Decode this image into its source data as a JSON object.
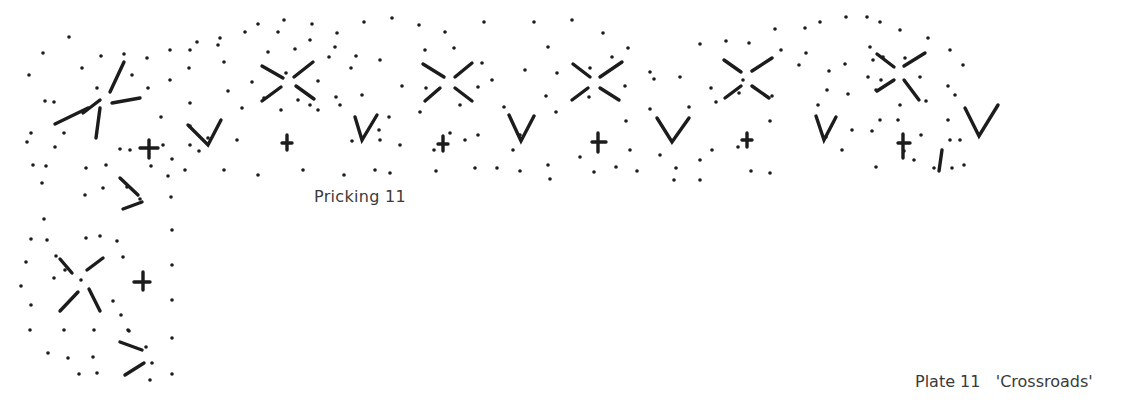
{
  "caption": {
    "label": "Pricking 11"
  },
  "plate": {
    "number": "Plate 11",
    "title": "'Crossroads'"
  },
  "colors": {
    "ink": "#1c1c1c",
    "text": "#3a3a3a",
    "background": "#ffffff"
  },
  "figure": {
    "motifs_top_row": [
      "X",
      "V",
      "+",
      "X",
      "V",
      "+",
      "X",
      "V",
      "+",
      "X",
      "V",
      "+",
      "X",
      "V",
      "+",
      "X",
      "V"
    ],
    "corner_motifs": [
      "star",
      "x-cross",
      ">",
      "X",
      "+",
      ">"
    ],
    "dots": [
      [
        69,
        37
      ],
      [
        43,
        53
      ],
      [
        101,
        56
      ],
      [
        124,
        54
      ],
      [
        147,
        58
      ],
      [
        170,
        50
      ],
      [
        197,
        42
      ],
      [
        220,
        38
      ],
      [
        245,
        32
      ],
      [
        278,
        32
      ],
      [
        310,
        40
      ],
      [
        335,
        47
      ],
      [
        356,
        56
      ],
      [
        29,
        75
      ],
      [
        82,
        68
      ],
      [
        45,
        101
      ],
      [
        31,
        133
      ],
      [
        54,
        102
      ],
      [
        64,
        133
      ],
      [
        55,
        147
      ],
      [
        97,
        88
      ],
      [
        132,
        75
      ],
      [
        148,
        88
      ],
      [
        161,
        117
      ],
      [
        189,
        68
      ],
      [
        163,
        145
      ],
      [
        27,
        142
      ],
      [
        33,
        165
      ],
      [
        46,
        166
      ],
      [
        86,
        168
      ],
      [
        106,
        165
      ],
      [
        120,
        149
      ],
      [
        130,
        150
      ],
      [
        151,
        166
      ],
      [
        172,
        159
      ],
      [
        190,
        145
      ],
      [
        199,
        151
      ],
      [
        168,
        176
      ],
      [
        42,
        183
      ],
      [
        85,
        195
      ],
      [
        103,
        188
      ],
      [
        140,
        199
      ],
      [
        171,
        197
      ],
      [
        127,
        187
      ],
      [
        44,
        219
      ],
      [
        47,
        240
      ],
      [
        31,
        239
      ],
      [
        26,
        262
      ],
      [
        21,
        286
      ],
      [
        31,
        305
      ],
      [
        56,
        256
      ],
      [
        54,
        278
      ],
      [
        65,
        270
      ],
      [
        86,
        238
      ],
      [
        100,
        236
      ],
      [
        117,
        241
      ],
      [
        123,
        257
      ],
      [
        81,
        280
      ],
      [
        113,
        301
      ],
      [
        121,
        315
      ],
      [
        129,
        331
      ],
      [
        146,
        347
      ],
      [
        152,
        363
      ],
      [
        150,
        380
      ],
      [
        172,
        230
      ],
      [
        172,
        265
      ],
      [
        172,
        300
      ],
      [
        172,
        338
      ],
      [
        172,
        374
      ],
      [
        30,
        330
      ],
      [
        64,
        330
      ],
      [
        94,
        330
      ],
      [
        128,
        330
      ],
      [
        48,
        353
      ],
      [
        68,
        358
      ],
      [
        93,
        357
      ],
      [
        79,
        374
      ],
      [
        97,
        373
      ],
      [
        190,
        50
      ],
      [
        218,
        45
      ],
      [
        258,
        24
      ],
      [
        284,
        20
      ],
      [
        312,
        24
      ],
      [
        337,
        33
      ],
      [
        364,
        22
      ],
      [
        392,
        18
      ],
      [
        419,
        25
      ],
      [
        445,
        32
      ],
      [
        170,
        80
      ],
      [
        224,
        62
      ],
      [
        268,
        52
      ],
      [
        295,
        49
      ],
      [
        329,
        57
      ],
      [
        351,
        68
      ],
      [
        380,
        60
      ],
      [
        425,
        50
      ],
      [
        454,
        48
      ],
      [
        482,
        63
      ],
      [
        190,
        103
      ],
      [
        228,
        91
      ],
      [
        252,
        82
      ],
      [
        286,
        73
      ],
      [
        318,
        81
      ],
      [
        340,
        105
      ],
      [
        362,
        95
      ],
      [
        402,
        86
      ],
      [
        426,
        88
      ],
      [
        460,
        105
      ],
      [
        478,
        87
      ],
      [
        190,
        126
      ],
      [
        242,
        108
      ],
      [
        264,
        98
      ],
      [
        310,
        105
      ],
      [
        336,
        97
      ],
      [
        379,
        130
      ],
      [
        389,
        117
      ],
      [
        420,
        112
      ],
      [
        450,
        133
      ],
      [
        478,
        135
      ],
      [
        208,
        138
      ],
      [
        237,
        140
      ],
      [
        281,
        110
      ],
      [
        298,
        100
      ],
      [
        318,
        110
      ],
      [
        352,
        141
      ],
      [
        380,
        140
      ],
      [
        400,
        145
      ],
      [
        434,
        150
      ],
      [
        465,
        140
      ],
      [
        185,
        170
      ],
      [
        224,
        170
      ],
      [
        258,
        175
      ],
      [
        303,
        170
      ],
      [
        344,
        175
      ],
      [
        375,
        170
      ],
      [
        390,
        173
      ],
      [
        436,
        171
      ],
      [
        475,
        168
      ],
      [
        497,
        168
      ],
      [
        484,
        22
      ],
      [
        534,
        22
      ],
      [
        572,
        20
      ],
      [
        603,
        33
      ],
      [
        612,
        57
      ],
      [
        628,
        48
      ],
      [
        650,
        72
      ],
      [
        700,
        44
      ],
      [
        726,
        41
      ],
      [
        749,
        43
      ],
      [
        775,
        29
      ],
      [
        805,
        28
      ],
      [
        492,
        80
      ],
      [
        525,
        70
      ],
      [
        548,
        47
      ],
      [
        557,
        73
      ],
      [
        590,
        68
      ],
      [
        625,
        86
      ],
      [
        654,
        79
      ],
      [
        680,
        77
      ],
      [
        711,
        88
      ],
      [
        743,
        80
      ],
      [
        781,
        50
      ],
      [
        799,
        65
      ],
      [
        504,
        107
      ],
      [
        520,
        135
      ],
      [
        546,
        96
      ],
      [
        556,
        112
      ],
      [
        589,
        97
      ],
      [
        626,
        121
      ],
      [
        650,
        109
      ],
      [
        689,
        107
      ],
      [
        716,
        102
      ],
      [
        739,
        93
      ],
      [
        772,
        96
      ],
      [
        513,
        150
      ],
      [
        520,
        171
      ],
      [
        548,
        165
      ],
      [
        580,
        157
      ],
      [
        630,
        150
      ],
      [
        660,
        155
      ],
      [
        676,
        168
      ],
      [
        700,
        160
      ],
      [
        738,
        147
      ],
      [
        770,
        121
      ],
      [
        550,
        179
      ],
      [
        594,
        172
      ],
      [
        616,
        167
      ],
      [
        637,
        171
      ],
      [
        674,
        180
      ],
      [
        700,
        180
      ],
      [
        712,
        150
      ],
      [
        751,
        171
      ],
      [
        770,
        173
      ],
      [
        820,
        22
      ],
      [
        846,
        17
      ],
      [
        867,
        17
      ],
      [
        880,
        22
      ],
      [
        900,
        30
      ],
      [
        928,
        38
      ],
      [
        950,
        50
      ],
      [
        963,
        65
      ],
      [
        806,
        53
      ],
      [
        829,
        71
      ],
      [
        845,
        64
      ],
      [
        870,
        47
      ],
      [
        873,
        60
      ],
      [
        883,
        57
      ],
      [
        905,
        58
      ],
      [
        920,
        77
      ],
      [
        948,
        86
      ],
      [
        818,
        105
      ],
      [
        827,
        90
      ],
      [
        848,
        94
      ],
      [
        868,
        77
      ],
      [
        876,
        90
      ],
      [
        881,
        80
      ],
      [
        900,
        105
      ],
      [
        926,
        101
      ],
      [
        948,
        120
      ],
      [
        955,
        95
      ],
      [
        826,
        137
      ],
      [
        852,
        130
      ],
      [
        872,
        131
      ],
      [
        880,
        120
      ],
      [
        898,
        120
      ],
      [
        921,
        135
      ],
      [
        950,
        140
      ],
      [
        960,
        140
      ],
      [
        842,
        150
      ],
      [
        876,
        167
      ],
      [
        904,
        151
      ],
      [
        914,
        160
      ],
      [
        934,
        168
      ],
      [
        952,
        168
      ],
      [
        964,
        165
      ]
    ],
    "marks": [
      "M83,113 L100,100",
      "M110,92 L124,62",
      "M55,124 L88,108",
      "M100,108 L96,138",
      "M112,103 L140,98",
      "M140,148 L158,148 M149,140 L149,158",
      "M120,178 L138,195",
      "M123,209 L142,202",
      "M60,259 L72,273",
      "M87,270 L103,258",
      "M60,311 L78,292",
      "M89,289 L100,311",
      "M134,282 L150,282 M143,272 L143,290",
      "M120,342 L142,350",
      "M125,375 L144,363",
      "M188,125 L208,145 L221,120",
      "M262,66 L283,78",
      "M294,77 L313,62",
      "M262,101 L281,87",
      "M296,86 L314,99",
      "M282,143 L292,143 M287,135 L287,150",
      "M355,117 L362,140 L377,115",
      "M423,64 L444,77",
      "M455,77 L472,63",
      "M425,101 L440,88",
      "M455,88 L472,101",
      "M438,144 L448,144 M443,136 L443,151",
      "M509,115 L521,141 L534,116",
      "M573,64 L590,77",
      "M600,77 L622,62",
      "M572,100 L588,88",
      "M600,88 L619,100",
      "M592,142 L606,142 M598,133 L598,152",
      "M657,118 L672,142 L689,118",
      "M724,60 L741,72",
      "M752,71 L772,58",
      "M725,98 L741,86",
      "M752,86 L769,98",
      "M742,140 L752,140 M747,133 L747,147",
      "M816,116 L824,140 L836,117",
      "M877,54 L894,67",
      "M904,66 L925,53",
      "M877,91 L894,80",
      "M904,80 L919,100",
      "M898,143 L910,143 M903,134 L903,158",
      "M942,150 L939,171",
      "M965,108 L979,136 L998,105"
    ]
  }
}
